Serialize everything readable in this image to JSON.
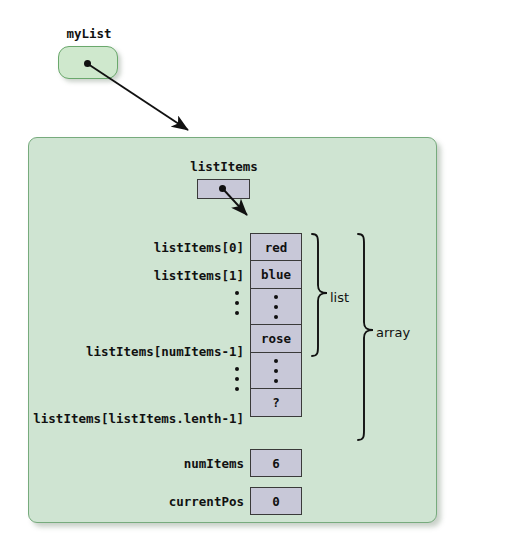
{
  "diagram": {
    "title_object": {
      "label": "myList",
      "pointer_icon": "pointer-dot"
    },
    "inner_object": {
      "field_label": "listItems",
      "pointer_icon": "pointer-dot"
    },
    "array_rows": [
      {
        "label": "listItems[0]",
        "value": "red",
        "kind": "value"
      },
      {
        "label": "listItems[1]",
        "value": "blue",
        "kind": "value"
      },
      {
        "label": "",
        "value": "",
        "kind": "ellipsis"
      },
      {
        "label": "listItems[numItems-1]",
        "value": "rose",
        "kind": "value"
      },
      {
        "label": "",
        "value": "",
        "kind": "ellipsis"
      },
      {
        "label": "listItems[listItems.lenth-1]",
        "value": "?",
        "kind": "value"
      }
    ],
    "scalar_rows": [
      {
        "label": "numItems",
        "value": "6"
      },
      {
        "label": "currentPos",
        "value": "0"
      }
    ],
    "braces": [
      {
        "label": "list"
      },
      {
        "label": "array"
      }
    ],
    "colors": {
      "panel_fill": "#cfe4d2",
      "panel_border": "#77ab7d",
      "object_fill": "#cfe8cd",
      "object_border": "#6aa86c",
      "cell_fill": "#c8c8d8",
      "cell_border": "#3a3a3a",
      "text": "#111111",
      "page_background": "#ffffff"
    }
  }
}
